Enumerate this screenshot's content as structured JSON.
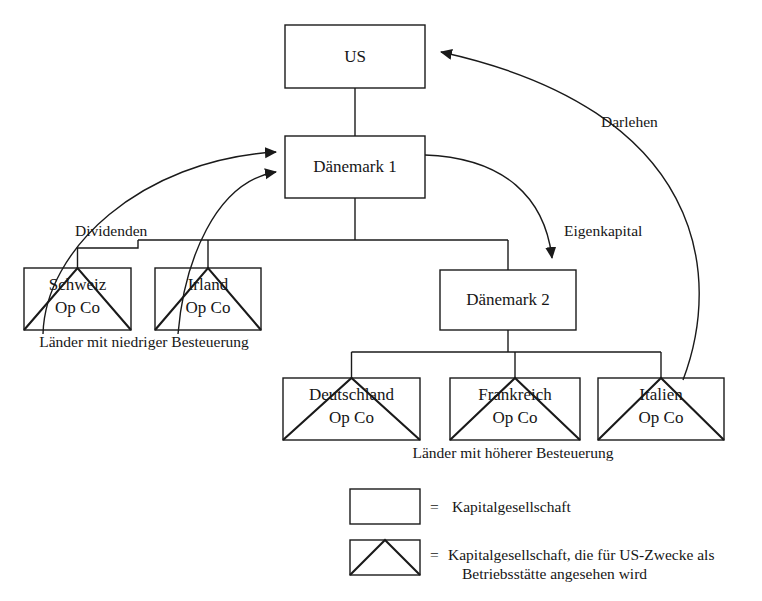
{
  "diagram": {
    "nodes": {
      "us": {
        "label": "US",
        "type": "corporation"
      },
      "daenemark1": {
        "label": "Dänemark 1",
        "type": "corporation"
      },
      "daenemark2": {
        "label": "Dänemark 2",
        "type": "corporation"
      },
      "schweiz": {
        "label_line1": "Schweiz",
        "label_line2": "Op Co",
        "type": "branch"
      },
      "irland": {
        "label_line1": "Irland",
        "label_line2": "Op Co",
        "type": "branch"
      },
      "deutschland": {
        "label_line1": "Deutschland",
        "label_line2": "Op Co",
        "type": "branch"
      },
      "frankreich": {
        "label_line1": "Frankreich",
        "label_line2": "Op Co",
        "type": "branch"
      },
      "italien": {
        "label_line1": "Italien",
        "label_line2": "Op Co",
        "type": "branch"
      }
    },
    "edge_labels": {
      "dividenden": "Dividenden",
      "darlehen": "Darlehen",
      "eigenkapital": "Eigenkapital"
    },
    "group_labels": {
      "low_tax": "Länder mit niedriger Besteuerung",
      "high_tax": "Länder mit höherer Besteuerung"
    }
  },
  "legend": {
    "items": [
      {
        "equals": "=",
        "text": "Kapitalgesellschaft",
        "shape": "rectangle"
      },
      {
        "equals": "=",
        "text_line1": "Kapitalgesellschaft, die für US-Zwecke als",
        "text_line2": "Betriebsstätte angesehen wird",
        "shape": "rectangle-with-triangle"
      }
    ]
  },
  "colors": {
    "stroke": "#1a1a1a",
    "background": "#ffffff",
    "text": "#161616"
  }
}
